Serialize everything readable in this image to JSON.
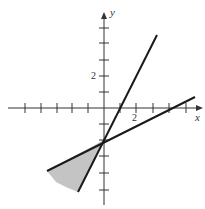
{
  "figure": {
    "type": "inequality-region-graph",
    "axes": {
      "x_label": "x",
      "y_label": "y",
      "x_tick_label": "2",
      "y_tick_label": "2",
      "x_ticks": [
        -6,
        -5,
        -4,
        -3,
        -2,
        -1,
        1,
        2,
        3,
        4,
        5,
        6
      ],
      "y_ticks": [
        -5,
        -4,
        -3,
        -2,
        -1,
        1,
        2,
        3,
        4,
        5
      ]
    },
    "lines": [
      {
        "name": "steep-line",
        "equation": "y = 2x - 2",
        "from": [
          -1.6,
          -5.2
        ],
        "to": [
          3.3,
          4.5
        ]
      },
      {
        "name": "shallow-line",
        "equation": "y = 0.5x - 2",
        "from": [
          -3.6,
          -3.8
        ],
        "to": [
          5.7,
          0.8
        ]
      }
    ],
    "intersection": [
      0,
      -2
    ],
    "shaded_region": "area below both lines, left of intersection (0,-2)",
    "colors": {
      "line": "#1a1a1a",
      "axis": "#333333",
      "shade": "#c4c4c4"
    }
  }
}
